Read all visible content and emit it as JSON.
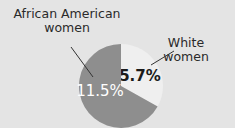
{
  "chart_data": {
    "type": "pie",
    "title": "",
    "slices": [
      {
        "label": "White women",
        "value": 5.7,
        "display": "5.7%",
        "color": "#efefef",
        "text_color": "#1a1a1a"
      },
      {
        "label": "African American women",
        "value": 11.5,
        "display": "11.5%",
        "color": "#8e8e8e",
        "text_color": "#ffffff"
      }
    ],
    "start_angle": "12 o'clock, clockwise"
  },
  "labels": {
    "aa_line1": "African American",
    "aa_line2": "women",
    "white": "White women"
  },
  "colors": {
    "background": "#e4e4e4"
  }
}
